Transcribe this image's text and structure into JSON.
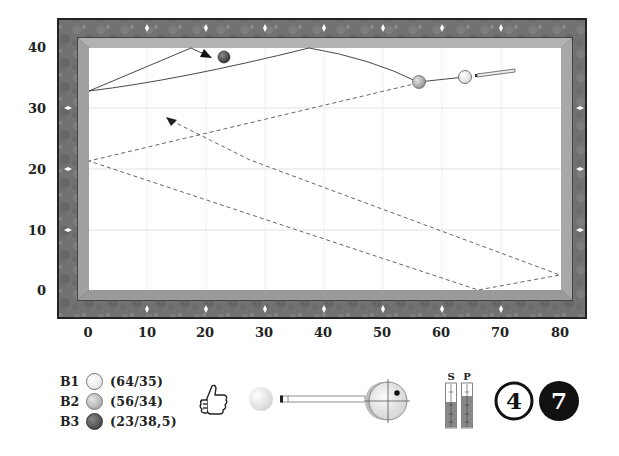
{
  "table": {
    "x_ticks": [
      "0",
      "10",
      "20",
      "30",
      "40",
      "50",
      "60",
      "70",
      "80"
    ],
    "y_ticks": [
      "0",
      "10",
      "20",
      "30",
      "40"
    ],
    "colors": {
      "frame": "#6f6f6f",
      "cushion": "#a8a8a8",
      "cloth": "#ffffff",
      "grid": "#d8d8d8",
      "diamond": "#ffffff"
    }
  },
  "balls": [
    {
      "key": "B1",
      "coord": "(64/35)",
      "x": 64,
      "y": 35,
      "color": "#f4f4f4"
    },
    {
      "key": "B2",
      "coord": "(56/34)",
      "x": 56,
      "y": 34,
      "color": "#b9b9b9"
    },
    {
      "key": "B3",
      "coord": "(23/38,5)",
      "x": 23,
      "y": 38.5,
      "color": "#555555"
    }
  ],
  "paths": {
    "cue_ball_solid": [
      [
        64,
        35
      ],
      [
        56,
        34
      ],
      [
        38,
        40
      ],
      [
        0,
        33
      ],
      [
        17.5,
        40
      ],
      [
        21,
        38.7
      ]
    ],
    "object_ball_dashed": [
      [
        56,
        34
      ],
      [
        0,
        21.5
      ],
      [
        66,
        0
      ],
      [
        80,
        2.5
      ],
      [
        13.5,
        28.5
      ]
    ]
  },
  "controls": {
    "rating_icon": "thumbs-up-icon",
    "stroke_icon": "cue-stroke-icon",
    "spin_icon": "ball-spin-target-icon",
    "gauges": {
      "speed_label": "S",
      "power_label": "P",
      "speed_level": 0.58,
      "power_level": 0.72
    },
    "badges": [
      {
        "value": "4",
        "style": "outline"
      },
      {
        "value": "7",
        "style": "filled"
      }
    ]
  }
}
